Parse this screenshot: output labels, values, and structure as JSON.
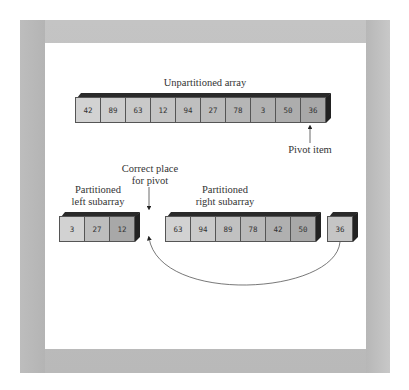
{
  "title": "Unpartitioned array",
  "unpartitioned": [
    "42",
    "89",
    "63",
    "12",
    "94",
    "27",
    "78",
    "3",
    "50",
    "36"
  ],
  "pivot_label": "Pivot item",
  "correct_place_label": [
    "Correct place",
    "for pivot"
  ],
  "left_label": [
    "Partitioned",
    "left subarray"
  ],
  "right_label": [
    "Partitioned",
    "right subarray"
  ],
  "left_subarray": [
    "3",
    "27",
    "12"
  ],
  "right_subarray": [
    "63",
    "94",
    "89",
    "78",
    "42",
    "50"
  ],
  "pivot_value": [
    "36"
  ],
  "colors": {
    "cell_light": "#d2d2d2",
    "cell_dark": "#a8a8a8",
    "frame": "#bfbfbf"
  }
}
